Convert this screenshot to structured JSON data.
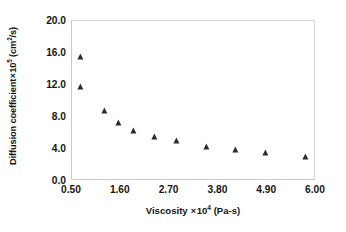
{
  "chart_data": {
    "type": "scatter",
    "title": "",
    "xlabel": "Viscosity × 10⁴ (Pa-s)",
    "ylabel": "Diffusion coefficient × 10⁵ (cm²/s)",
    "xlabel_parts": {
      "name": "Viscosity",
      "times": "×",
      "base": "10",
      "exponent": "4",
      "units": "(Pa-s)"
    },
    "ylabel_parts": {
      "name": "Diffusion coefficient",
      "times": "×",
      "base": "10",
      "exponent": "5",
      "units": "(cm",
      "units_exp": "2",
      "units_tail": "/s)"
    },
    "xlim": [
      0.5,
      6.0
    ],
    "ylim": [
      0.0,
      20.0
    ],
    "xticks": [
      "0.50",
      "1.60",
      "2.70",
      "3.80",
      "4.90",
      "6.00"
    ],
    "xtick_values": [
      0.5,
      1.6,
      2.7,
      3.8,
      4.9,
      6.0
    ],
    "yticks": [
      "0.0",
      "4.0",
      "8.0",
      "12.0",
      "16.0",
      "20.0"
    ],
    "ytick_values": [
      0.0,
      4.0,
      8.0,
      12.0,
      16.0,
      20.0
    ],
    "grid": false,
    "legend": null,
    "marker": "triangle-up",
    "marker_color": "#2b2b33",
    "frame_color": "#c9c9cf",
    "series": [
      {
        "name": "diffusion coefficient",
        "x": [
          0.7,
          0.7,
          1.24,
          1.55,
          1.9,
          2.38,
          2.87,
          3.55,
          4.2,
          4.88,
          5.78
        ],
        "y": [
          15.5,
          11.8,
          8.7,
          7.3,
          6.2,
          5.5,
          5.0,
          4.3,
          3.85,
          3.5,
          3.0
        ]
      }
    ]
  }
}
